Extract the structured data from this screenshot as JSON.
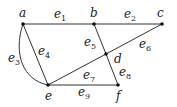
{
  "diagram": {
    "type": "graph",
    "nodes": [
      {
        "id": "a",
        "label": "a",
        "x": 23,
        "y": 24,
        "lx": 19,
        "ly": 17
      },
      {
        "id": "b",
        "label": "b",
        "x": 94,
        "y": 24,
        "lx": 90,
        "ly": 17
      },
      {
        "id": "c",
        "label": "c",
        "x": 162,
        "y": 24,
        "lx": 157,
        "ly": 17
      },
      {
        "id": "d",
        "label": "d",
        "x": 106,
        "y": 54,
        "lx": 114,
        "ly": 63
      },
      {
        "id": "e",
        "label": "e",
        "x": 48,
        "y": 85,
        "lx": 45,
        "ly": 100
      },
      {
        "id": "f",
        "label": "f",
        "x": 118,
        "y": 85,
        "lx": 116,
        "ly": 100
      }
    ],
    "edges": [
      {
        "id": "e1",
        "base": "e",
        "sub": "1",
        "from": "a",
        "to": "b",
        "lx": 54,
        "ly": 18
      },
      {
        "id": "e2",
        "base": "e",
        "sub": "2",
        "from": "b",
        "to": "c",
        "lx": 124,
        "ly": 18
      },
      {
        "id": "e3",
        "base": "e",
        "sub": "3",
        "from": "a",
        "to": "e",
        "curved": true,
        "lx": 8,
        "ly": 62
      },
      {
        "id": "e4",
        "base": "e",
        "sub": "4",
        "from": "a",
        "to": "e",
        "lx": 38,
        "ly": 55
      },
      {
        "id": "e5",
        "base": "e",
        "sub": "5",
        "from": "b",
        "to": "d",
        "lx": 84,
        "ly": 46
      },
      {
        "id": "e6",
        "base": "e",
        "sub": "6",
        "from": "c",
        "to": "d",
        "lx": 139,
        "ly": 48
      },
      {
        "id": "e7",
        "base": "e",
        "sub": "7",
        "from": "d",
        "to": "e",
        "lx": 83,
        "ly": 79
      },
      {
        "id": "e8",
        "base": "e",
        "sub": "8",
        "from": "d",
        "to": "f",
        "lx": 119,
        "ly": 76
      },
      {
        "id": "e9",
        "base": "e",
        "sub": "9",
        "from": "e",
        "to": "f",
        "lx": 78,
        "ly": 96
      }
    ]
  }
}
